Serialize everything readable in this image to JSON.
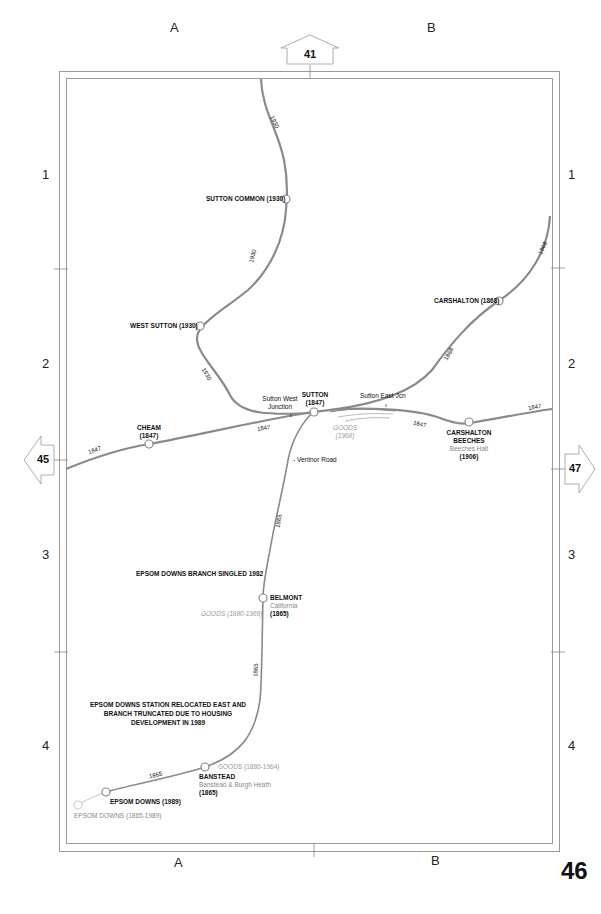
{
  "page": {
    "number": "46"
  },
  "grid": {
    "columns": [
      "A",
      "B"
    ],
    "rows": [
      "1",
      "2",
      "3",
      "4"
    ]
  },
  "adjacent_pages": {
    "north": "41",
    "west": "45",
    "east": "47"
  },
  "colors": {
    "line": "#8a8a8a",
    "frame": "#9a9a9a",
    "disused": "#bbbbbb",
    "station_fill": "#ffffff"
  },
  "stations": {
    "sutton_common": {
      "name": "SUTTON COMMON (1930)"
    },
    "west_sutton": {
      "name": "WEST SUTTON (1930)"
    },
    "carshalton": {
      "name": "CARSHALTON (1868)"
    },
    "cheam": {
      "name": "CHEAM",
      "date": "(1847)"
    },
    "sutton": {
      "name": "SUTTON",
      "date": "(1847)"
    },
    "carshalton_beeches": {
      "name_line1": "CARSHALTON",
      "name_line2": "BEECHES",
      "former": "Beeches Halt",
      "date": "(1906)"
    },
    "belmont": {
      "name": "BELMONT",
      "former": "California",
      "date": "(1865)"
    },
    "banstead": {
      "name": "BANSTEAD",
      "former": "Banstead & Burgh Heath",
      "date": "(1865)"
    },
    "epsom_downs_new": {
      "name": "EPSOM DOWNS (1989)"
    },
    "epsom_downs_old": {
      "name": "EPSOM DOWNS (1865-1989)"
    }
  },
  "junctions": {
    "sutton_west": {
      "line1": "Sutton West",
      "line2": "Junction"
    },
    "sutton_east": {
      "label": "Sutton East Jcn"
    },
    "ventnor_road": {
      "label": "- Ventnor Road"
    }
  },
  "goods": {
    "sutton": {
      "line1": "GOODS",
      "line2": "(1968)"
    },
    "belmont": {
      "label": "GOODS (1880-1969)"
    },
    "banstead": {
      "label": "GOODS (1880-1964)"
    }
  },
  "line_dates": {
    "north_top": "1930",
    "north_mid": "1930",
    "north_low": "1930",
    "carshalton_upper": "1868",
    "carshalton_lower": "1868",
    "main_west": "1847",
    "main_mid": "1847",
    "main_east1": "1847",
    "main_east2": "1847",
    "branch_upper": "1865",
    "branch_mid": "1865",
    "branch_low": "1865"
  },
  "notes": {
    "singled": "EPSOM DOWNS BRANCH SINGLED 1982",
    "relocated_line1": "EPSOM DOWNS STATION RELOCATED EAST AND",
    "relocated_line2": "BRANCH TRUNCATED DUE TO HOUSING",
    "relocated_line3": "DEVELOPMENT IN 1989"
  }
}
